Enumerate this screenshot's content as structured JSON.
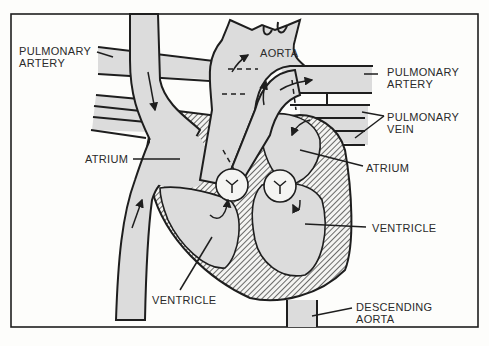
{
  "diagram": {
    "colors": {
      "background": "#fdfdfb",
      "vessel_fill": "#dcdcdc",
      "outline": "#1e1e1e",
      "label": "#2a2a2a"
    },
    "labels": {
      "pulmonary_artery_left": [
        "PULMONARY",
        "ARTERY"
      ],
      "aorta_top": "AORTA",
      "pulmonary_artery_right": [
        "PULMONARY",
        "ARTERY"
      ],
      "pulmonary_vein": [
        "PULMONARY",
        "VEIN"
      ],
      "atrium_left": "ATRIUM",
      "atrium_right": "ATRIUM",
      "ventricle_right": "VENTRICLE",
      "ventricle_left": "VENTRICLE",
      "descending_aorta": [
        "DESCENDING",
        "AORTA"
      ]
    }
  }
}
